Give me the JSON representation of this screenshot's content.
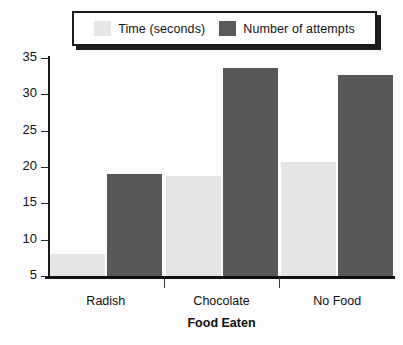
{
  "chart_data": {
    "type": "bar",
    "title": "",
    "xlabel": "Food Eaten",
    "ylabel": "",
    "categories": [
      "Radish",
      "Chocolate",
      "No Food"
    ],
    "series": [
      {
        "name": "Time (seconds)",
        "color": "#e4e4e4",
        "values": [
          8.0,
          18.8,
          20.7
        ]
      },
      {
        "name": "Number of attempts",
        "color": "#585858",
        "values": [
          19.1,
          33.6,
          32.6
        ]
      }
    ],
    "ylim": [
      5,
      35
    ],
    "yticks": [
      35,
      30,
      25,
      20,
      15,
      10,
      5
    ],
    "ytick_labels": [
      "35",
      "30",
      "25",
      "20",
      "15",
      "10",
      "5"
    ],
    "grid": false,
    "legend_position": "top"
  },
  "legend": {
    "entries": [
      {
        "label": "Time (seconds)",
        "swatch": "light-gray-swatch"
      },
      {
        "label": "Number of attempts",
        "swatch": "dark-gray-swatch"
      }
    ]
  },
  "axis": {
    "x_title": "Food Eaten"
  }
}
